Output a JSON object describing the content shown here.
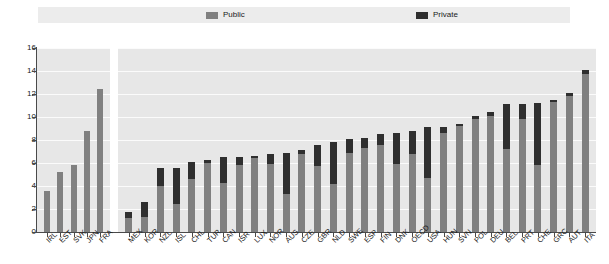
{
  "legend": {
    "items": [
      {
        "label": "Public",
        "color": "#808080",
        "icon": "legend-swatch-icon"
      },
      {
        "label": "Private",
        "color": "#2f2f2f",
        "icon": "legend-swatch-icon"
      }
    ]
  },
  "axis": {
    "y_ticks": [
      "16",
      "14",
      "12",
      "10",
      "8",
      "6",
      "4",
      "2",
      "0"
    ]
  },
  "colors": {
    "public": "#808080",
    "private": "#2f2f2f",
    "plot_background": "#e7e7e7",
    "gridline": "#fbfbfb",
    "legend_background": "#ececec",
    "axis": "#4a4a4a"
  },
  "chart_data": {
    "type": "bar",
    "title": "",
    "subtitle": "",
    "xlabel": "",
    "ylabel": "",
    "ylim": [
      0,
      16
    ],
    "ytick_interval": 2,
    "grid": true,
    "stacked": true,
    "legend_position": "top",
    "panels": [
      {
        "name": "left-panel",
        "categories": [
          "IRL",
          "EST",
          "SVK",
          "JPN",
          "FRA"
        ],
        "series": [
          {
            "name": "Public",
            "values": [
              3.6,
              5.2,
              5.8,
              8.8,
              12.4
            ]
          },
          {
            "name": "Private",
            "values": [
              0.0,
              0.0,
              0.0,
              0.0,
              0.0
            ]
          }
        ],
        "totals": [
          3.6,
          5.2,
          5.8,
          8.8,
          12.4
        ]
      },
      {
        "name": "right-panel",
        "categories": [
          "MEX",
          "KOR",
          "NZL",
          "ISL",
          "CHL",
          "TUR",
          "CAN",
          "ISR",
          "LUX",
          "NOR",
          "AUS",
          "CZE",
          "GBR",
          "NLD",
          "SWE",
          "ESP",
          "FIN",
          "DNK",
          "OECD",
          "USA",
          "HUN",
          "SVN",
          "POL",
          "DEU",
          "BEL",
          "PRT",
          "CHE",
          "GRC",
          "AUT",
          "ITA"
        ],
        "series": [
          {
            "name": "Public",
            "values": [
              1.2,
              1.3,
              4.0,
              2.4,
              4.6,
              6.0,
              4.3,
              5.8,
              6.4,
              5.9,
              3.3,
              6.8,
              5.7,
              4.2,
              6.9,
              7.3,
              7.6,
              5.9,
              6.8,
              4.7,
              8.6,
              9.2,
              9.8,
              10.1,
              7.2,
              9.8,
              5.8,
              11.3,
              11.8,
              13.7
            ]
          },
          {
            "name": "Private",
            "values": [
              0.5,
              1.3,
              1.6,
              3.2,
              1.5,
              0.3,
              2.2,
              0.7,
              0.2,
              0.9,
              3.6,
              0.3,
              1.9,
              3.6,
              1.2,
              0.9,
              0.9,
              2.7,
              2.0,
              4.4,
              0.5,
              0.2,
              0.3,
              0.3,
              3.9,
              1.3,
              5.4,
              0.2,
              0.3,
              0.4
            ]
          }
        ],
        "totals": [
          1.7,
          2.6,
          5.6,
          5.6,
          6.1,
          6.3,
          6.5,
          6.5,
          6.6,
          6.8,
          6.9,
          7.1,
          7.6,
          7.8,
          8.1,
          8.2,
          8.5,
          8.6,
          8.8,
          9.1,
          9.1,
          9.4,
          10.1,
          10.4,
          11.1,
          11.1,
          11.2,
          11.5,
          12.1,
          14.1
        ]
      }
    ]
  }
}
